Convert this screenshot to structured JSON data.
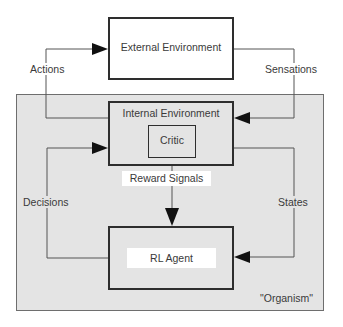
{
  "diagram": {
    "nodes": {
      "external_environment": "External Environment",
      "internal_environment": "Internal Environment",
      "critic": "Critic",
      "rl_agent": "RL Agent"
    },
    "edges": {
      "actions": "Actions",
      "sensations": "Sensations",
      "reward_signals": "Reward Signals",
      "decisions": "Decisions",
      "states": "States"
    },
    "region_label": "\"Organism\"",
    "colors": {
      "organism_fill": "#e4e4e4",
      "box_border": "#2e2e2e",
      "line": "#555555",
      "arrow": "#111111"
    }
  }
}
